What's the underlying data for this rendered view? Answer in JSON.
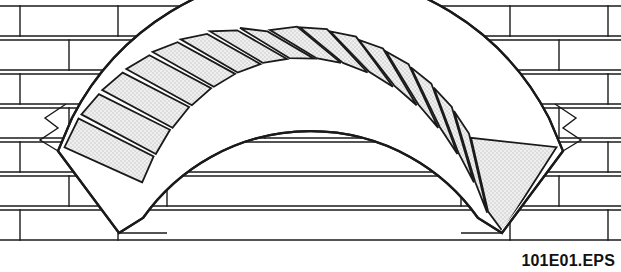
{
  "figure": {
    "caption": "101E01.EPS",
    "canvas": {
      "width": 621,
      "height": 272
    },
    "colors": {
      "background": "#ffffff",
      "line": "#1a1a1a",
      "voussoir_fill": "#e9e9e9",
      "brick_fill": "#ffffff",
      "caption_text": "#111111"
    },
    "line_widths": {
      "brick": 1.4,
      "voussoir": 1.8,
      "arch_outline": 2.2
    }
  },
  "arch": {
    "type": "segmental",
    "voussoir_count": 17,
    "keystone_index": 8,
    "span_px": 500,
    "rise_px": 120,
    "center": {
      "x": 310,
      "y": 300
    },
    "radius_intrados": 205,
    "radius_extrados": 268,
    "angle_start_deg": 215,
    "angle_end_deg": 325,
    "voussoirs": [
      {
        "index": 0,
        "label": "springer-left"
      },
      {
        "index": 1,
        "label": "voussoir"
      },
      {
        "index": 2,
        "label": "voussoir"
      },
      {
        "index": 3,
        "label": "voussoir"
      },
      {
        "index": 4,
        "label": "voussoir"
      },
      {
        "index": 5,
        "label": "voussoir"
      },
      {
        "index": 6,
        "label": "voussoir"
      },
      {
        "index": 7,
        "label": "voussoir"
      },
      {
        "index": 8,
        "label": "keystone"
      },
      {
        "index": 9,
        "label": "voussoir"
      },
      {
        "index": 10,
        "label": "voussoir"
      },
      {
        "index": 11,
        "label": "voussoir"
      },
      {
        "index": 12,
        "label": "voussoir"
      },
      {
        "index": 13,
        "label": "voussoir"
      },
      {
        "index": 14,
        "label": "voussoir"
      },
      {
        "index": 15,
        "label": "voussoir"
      },
      {
        "index": 16,
        "label": "springer-right"
      }
    ]
  },
  "wall": {
    "bond": "running-bond",
    "course_lines_y": [
      6,
      36,
      40,
      70,
      74,
      104,
      108,
      138,
      142,
      172,
      176,
      206,
      210,
      240
    ],
    "course_height": 30,
    "joint_height": 4,
    "courses": [
      {
        "index": 0,
        "y": 6,
        "offset": -35,
        "brick_width": 98
      },
      {
        "index": 1,
        "y": 40,
        "offset": 14,
        "brick_width": 98
      },
      {
        "index": 2,
        "y": 74,
        "offset": -35,
        "brick_width": 98
      },
      {
        "index": 3,
        "y": 108,
        "offset": 14,
        "brick_width": 98
      },
      {
        "index": 4,
        "y": 142,
        "offset": -35,
        "brick_width": 98
      },
      {
        "index": 5,
        "y": 176,
        "offset": 14,
        "brick_width": 98
      },
      {
        "index": 6,
        "y": 210,
        "offset": -35,
        "brick_width": 98
      }
    ]
  }
}
